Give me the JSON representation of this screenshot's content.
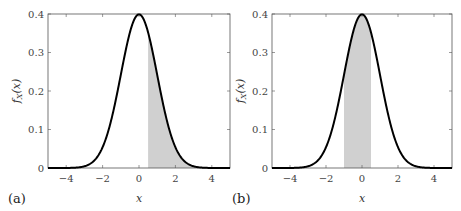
{
  "chart_data": [
    {
      "type": "line",
      "panel_label": "(a)",
      "xlabel": "x",
      "ylabel": "f_X(x)",
      "xlim": [
        -5,
        5
      ],
      "ylim": [
        0,
        0.4
      ],
      "xticks": [
        "−4",
        "−2",
        "0",
        "2",
        "4"
      ],
      "yticks": [
        "0",
        "0.1",
        "0.2",
        "0.3",
        "0.4"
      ],
      "series": [
        {
          "name": "standard normal pdf",
          "mean": 0,
          "std": 1
        }
      ],
      "shaded_region": [
        0.5,
        5
      ],
      "shade_color": "#d0d0d0",
      "line_color": "#000000"
    },
    {
      "type": "line",
      "panel_label": "(b)",
      "xlabel": "x",
      "ylabel": "f_X(x)",
      "xlim": [
        -5,
        5
      ],
      "ylim": [
        0,
        0.4
      ],
      "xticks": [
        "−4",
        "−2",
        "0",
        "2",
        "4"
      ],
      "yticks": [
        "0",
        "0.1",
        "0.2",
        "0.3",
        "0.4"
      ],
      "series": [
        {
          "name": "standard normal pdf",
          "mean": 0,
          "std": 1
        }
      ],
      "shaded_region": [
        -1,
        0.5
      ],
      "shade_color": "#d0d0d0",
      "line_color": "#000000"
    }
  ]
}
